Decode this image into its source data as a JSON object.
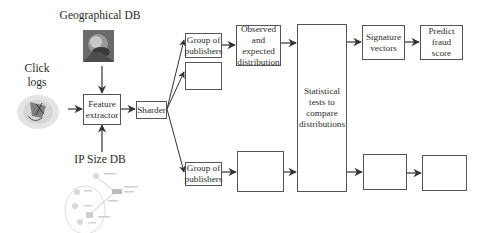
{
  "inputs": {
    "geographical_db": {
      "label": "Geographical DB",
      "icon": "globe-portrait-image"
    },
    "click_logs": {
      "label": "Click\nlogs",
      "icon": "click-logs-image"
    },
    "ip_size_db": {
      "label": "IP Size DB",
      "icon": "network-diagram-image"
    }
  },
  "pipeline": {
    "feature_extractor": "Feature\nextractor",
    "sharder": "Sharder",
    "branches": [
      {
        "group": "Group of\npublishers",
        "distribution": "Observed\nand expected\ndistribution"
      },
      {
        "group": "",
        "distribution": ""
      },
      {
        "group": "Group of\npublishers",
        "distribution": ""
      }
    ],
    "statistical_tests": "Statistical\ntests to\ncompare\ndistributions",
    "outputs": [
      {
        "signature": "Signature\nvectors",
        "predict": "Predict\nfraud score"
      },
      {
        "signature": "",
        "predict": ""
      }
    ]
  },
  "colors": {
    "stroke": "#555555",
    "arrow": "#333333",
    "text": "#2e2e2e"
  }
}
